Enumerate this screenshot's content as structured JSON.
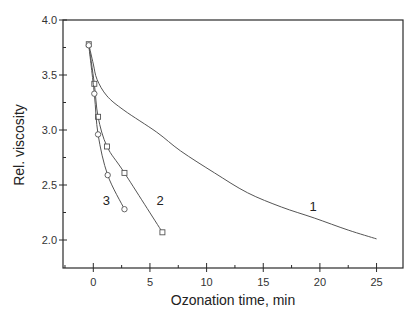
{
  "chart_data": {
    "type": "line",
    "title": "",
    "xlabel": "Ozonation time, min",
    "ylabel": "Rel. viscosity",
    "xlim": [
      -2.65,
      27.5
    ],
    "ylim": [
      1.77,
      4.0
    ],
    "x_ticks": [
      0,
      5,
      10,
      15,
      20,
      25
    ],
    "x_tick_labels": [
      "0",
      "5",
      "10",
      "15",
      "20",
      "25"
    ],
    "x_minor_ticks": [
      -2.5,
      2.5,
      7.5,
      12.5,
      17.5,
      22.5
    ],
    "y_ticks": [
      2.0,
      2.5,
      3.0,
      3.5,
      4.0
    ],
    "y_tick_labels": [
      "2.0",
      "2.5",
      "3.0",
      "3.5",
      "4.0"
    ],
    "y_minor_ticks": [
      2.25,
      2.75,
      3.25,
      3.75
    ],
    "grid": false,
    "legend": "none (curves labeled inline 1, 2, 3)",
    "series": [
      {
        "name": "1",
        "marker": "none",
        "label_pos": [
          19.4,
          2.31
        ],
        "points": [
          [
            -0.4,
            3.78
          ],
          [
            0.0,
            3.6
          ],
          [
            0.33,
            3.46
          ],
          [
            1.2,
            3.31
          ],
          [
            2.7,
            3.18
          ],
          [
            5.6,
            2.98
          ],
          [
            7.7,
            2.81
          ],
          [
            10.7,
            2.61
          ],
          [
            13.6,
            2.43
          ],
          [
            16.6,
            2.3
          ],
          [
            19.5,
            2.2
          ],
          [
            22.5,
            2.09
          ],
          [
            25.0,
            2.01
          ]
        ]
      },
      {
        "name": "2",
        "marker": "square",
        "label_pos": [
          5.9,
          2.36
        ],
        "points": [
          [
            -0.4,
            3.78
          ],
          [
            0.09,
            3.42
          ],
          [
            0.42,
            3.12
          ],
          [
            1.21,
            2.85
          ],
          [
            2.75,
            2.61
          ],
          [
            6.1,
            2.07
          ]
        ]
      },
      {
        "name": "3",
        "marker": "circle",
        "label_pos": [
          1.15,
          2.36
        ],
        "points": [
          [
            -0.4,
            3.77
          ],
          [
            0.09,
            3.33
          ],
          [
            0.42,
            2.96
          ],
          [
            1.27,
            2.59
          ],
          [
            2.75,
            2.28
          ]
        ]
      }
    ]
  },
  "labels": {
    "xlabel": "Ozonation time, min",
    "ylabel": "Rel. viscosity"
  }
}
